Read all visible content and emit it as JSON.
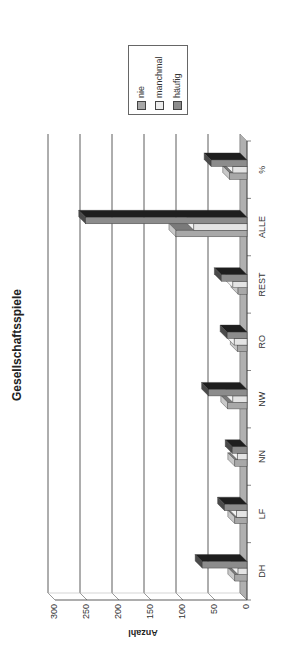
{
  "chart_data": {
    "type": "bar",
    "title": "Gesellschaftsspiele",
    "xlabel": "",
    "ylabel": "Anzahl",
    "ylim": [
      0,
      300
    ],
    "yticks": [
      0,
      50,
      100,
      150,
      200,
      250,
      300
    ],
    "grid": true,
    "orientation": "3d-clustered-column, page rotated 90deg",
    "legend_position": "right",
    "categories": [
      "DH",
      "LF",
      "NN",
      "NW",
      "RO",
      "REST",
      "ALLE",
      "%"
    ],
    "series": [
      {
        "name": "nie",
        "color": "#a8a8a8",
        "values": [
          19,
          19,
          19,
          30,
          15,
          14,
          111,
          27
        ]
      },
      {
        "name": "manchmal",
        "color": "#e4e4e4",
        "values": [
          14,
          16,
          15,
          22,
          20,
          22,
          83,
          22
        ]
      },
      {
        "name": "häufig",
        "color": "#8c8c8c",
        "values": [
          70,
          35,
          23,
          60,
          31,
          40,
          252,
          56
        ]
      }
    ]
  },
  "legend": {
    "items": [
      {
        "label": "nie",
        "color": "#a8a8a8"
      },
      {
        "label": "manchmal",
        "color": "#e4e4e4"
      },
      {
        "label": "häufig",
        "color": "#8c8c8c"
      }
    ]
  },
  "axis": {
    "tick_labels": [
      "0",
      "50",
      "100",
      "150",
      "200",
      "250",
      "300"
    ]
  }
}
